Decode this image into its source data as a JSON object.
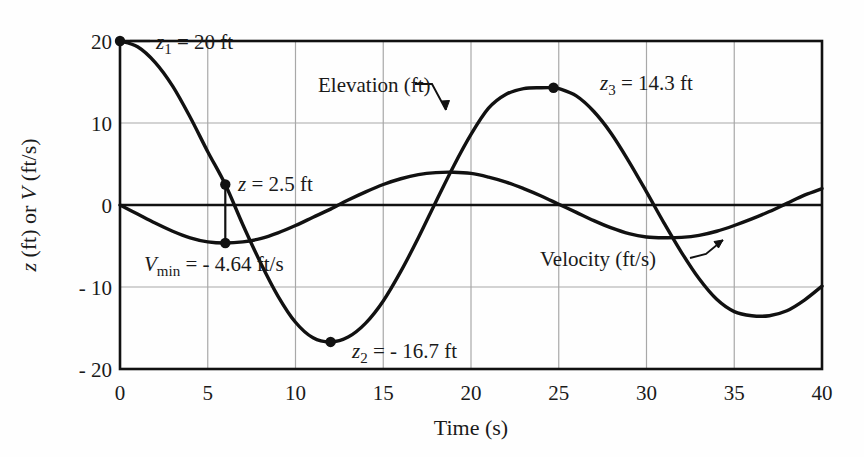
{
  "chart_data": {
    "type": "line",
    "title": "",
    "xlabel": "Time (s)",
    "ylabel": "z (ft) or V (ft/s)",
    "xlim": [
      0,
      40
    ],
    "ylim": [
      -20,
      20
    ],
    "xticks": [
      "0",
      "5",
      "10",
      "15",
      "20",
      "25",
      "30",
      "35",
      "40"
    ],
    "xtick_values": [
      0,
      5,
      10,
      15,
      20,
      25,
      30,
      35,
      40
    ],
    "yticks": [
      "20",
      "10",
      "0",
      "- 10",
      "- 20"
    ],
    "ytick_values": [
      20,
      10,
      0,
      -10,
      -20
    ],
    "grid": true,
    "legend_position": "inline-annotations",
    "series": [
      {
        "name": "Elevation (ft)",
        "x": [
          0,
          1,
          2,
          3,
          4,
          5,
          6,
          7,
          8,
          9,
          10,
          11,
          12,
          13,
          14,
          15,
          16,
          17,
          18,
          19,
          20,
          21,
          22,
          23,
          24,
          24.7,
          25,
          26,
          27,
          28,
          29,
          30,
          31,
          32,
          33,
          34,
          35,
          36,
          37,
          38,
          39,
          40
        ],
        "values": [
          20.0,
          19.3,
          17.4,
          14.5,
          10.7,
          6.5,
          2.5,
          -2.4,
          -7.0,
          -11.1,
          -14.3,
          -16.2,
          -16.7,
          -16.1,
          -14.4,
          -11.7,
          -8.1,
          -4.0,
          0.4,
          4.7,
          8.6,
          11.8,
          13.5,
          14.2,
          14.3,
          14.3,
          14.2,
          13.3,
          11.4,
          8.7,
          5.3,
          1.6,
          -2.2,
          -5.8,
          -9.0,
          -11.5,
          -13.0,
          -13.5,
          -13.5,
          -12.9,
          -11.6,
          -9.9
        ]
      },
      {
        "name": "Velocity (ft/s)",
        "x": [
          0,
          1,
          2,
          3,
          4,
          5,
          6,
          7,
          8,
          9,
          10,
          11,
          12,
          13,
          14,
          15,
          16,
          17,
          18,
          19,
          20,
          21,
          22,
          23,
          24,
          25,
          26,
          27,
          28,
          29,
          30,
          31,
          32,
          33,
          34,
          35,
          36,
          37,
          38,
          39,
          40
        ],
        "values": [
          0.0,
          -1.1,
          -2.2,
          -3.2,
          -4.0,
          -4.5,
          -4.64,
          -4.5,
          -4.1,
          -3.4,
          -2.5,
          -1.5,
          -0.5,
          0.6,
          1.6,
          2.5,
          3.2,
          3.7,
          3.95,
          4.0,
          3.85,
          3.4,
          2.8,
          2.0,
          1.1,
          0.1,
          -0.9,
          -1.9,
          -2.8,
          -3.5,
          -3.9,
          -4.0,
          -3.95,
          -3.7,
          -3.2,
          -2.5,
          -1.7,
          -0.8,
          0.2,
          1.2,
          2.0
        ]
      }
    ],
    "annotations": [
      {
        "name": "z1",
        "text_main": "z",
        "text_sub": "1",
        "text_rest": " = 20 ft",
        "x": 0,
        "y": 20,
        "marker": true
      },
      {
        "name": "z-2p5",
        "text_main": "z",
        "text_sub": "",
        "text_rest": " = 2.5 ft",
        "x": 6,
        "y": 2.5,
        "marker": true
      },
      {
        "name": "Vmin",
        "text_main": "V",
        "text_sub": "min",
        "text_rest": " = - 4.64 ft/s",
        "x": 6,
        "y": -4.64,
        "marker": true
      },
      {
        "name": "z2",
        "text_main": "z",
        "text_sub": "2",
        "text_rest": " = - 16.7 ft",
        "x": 12,
        "y": -16.7,
        "marker": true
      },
      {
        "name": "z3",
        "text_main": "z",
        "text_sub": "3",
        "text_rest": " = 14.3 ft",
        "x": 24.7,
        "y": 14.3,
        "marker": true
      },
      {
        "name": "elevation-label",
        "text_main": "Elevation (ft)",
        "arrow_to_x": 21.5,
        "arrow_to_y": 9.2
      },
      {
        "name": "velocity-label",
        "text_main": "Velocity (ft/s)",
        "arrow_to_x": 30.3,
        "arrow_to_y": -3.85
      }
    ]
  },
  "axis": {
    "x_title": "Time (s)",
    "y_title_parts": {
      "z": "z",
      "mid": " (ft) or ",
      "V": "V",
      "end": " (ft/s)"
    },
    "y_title_full": "z (ft) or V (ft/s)"
  },
  "labels": {
    "y_20": "20",
    "y_10": "10",
    "y_0": "0",
    "y_n10": "- 10",
    "y_n20": "- 20",
    "x_0": "0",
    "x_5": "5",
    "x_10": "10",
    "x_15": "15",
    "x_20": "20",
    "x_25": "25",
    "x_30": "30",
    "x_35": "35",
    "x_40": "40",
    "z1_main": "z",
    "z1_sub": "1",
    "z1_rest": " = 20 ft",
    "z25_main": "z",
    "z25_rest": " = 2.5 ft",
    "vmin_main": "V",
    "vmin_sub": "min",
    "vmin_rest": " = - 4.64 ft/s",
    "z2_main": "z",
    "z2_sub": "2",
    "z2_rest": " = - 16.7 ft",
    "z3_main": "z",
    "z3_sub": "3",
    "z3_rest": " = 14.3 ft",
    "elevation": "Elevation (ft)",
    "velocity": "Velocity (ft/s)"
  },
  "colors": {
    "curve": "#111111",
    "axis": "#111111",
    "grid": "#a8a8a8",
    "background": "#fefefe",
    "text": "#1a1a1a"
  }
}
